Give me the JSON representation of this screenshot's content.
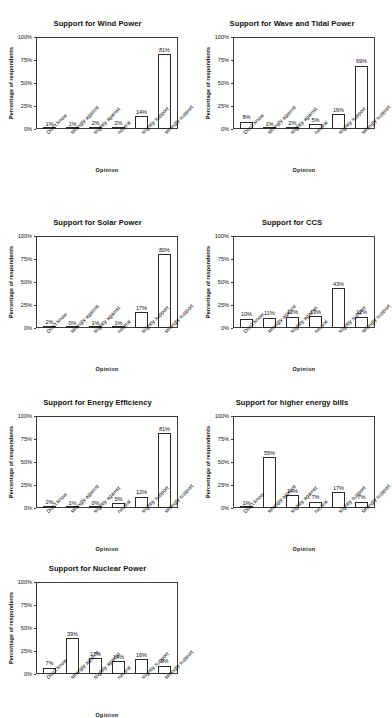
{
  "page": {
    "background": "#ffffff",
    "bar_fill": "#ffffff",
    "bar_stroke": "#2a2a2a",
    "axis_color": "#3b3b3b",
    "text_color": "#111111"
  },
  "shared": {
    "categories": [
      "Don't know",
      "strongly against",
      "slightly against",
      "neutral",
      "slightly support",
      "strongly support"
    ],
    "ylabel": "Percentage of respondents",
    "xlabel": "Opinion",
    "yticks": [
      "0%",
      "25%",
      "50%",
      "75%",
      "100%"
    ],
    "ytick_values": [
      0,
      25,
      50,
      75,
      100
    ],
    "ylim": [
      0,
      100
    ],
    "grid": false,
    "legend": "none"
  },
  "chart_data": [
    {
      "type": "bar",
      "title": "Support for Wind Power",
      "categories": [
        "Don't know",
        "strongly against",
        "slightly against",
        "neutral",
        "slightly support",
        "strongly support"
      ],
      "values": [
        1,
        1,
        2,
        2,
        14,
        81
      ],
      "labels": [
        "1%",
        "1%",
        "2%",
        "2%",
        "14%",
        "81%"
      ],
      "xlabel": "Opinion",
      "ylabel": "Percentage of respondents",
      "ylim": [
        0,
        100
      ]
    },
    {
      "type": "bar",
      "title": "Support for Wave and Tidal Power",
      "categories": [
        "Don't know",
        "strongly against",
        "slightly against",
        "neutral",
        "slightly support",
        "strongly support"
      ],
      "values": [
        8,
        1,
        2,
        5,
        16,
        69
      ],
      "labels": [
        "8%",
        "1%",
        "2%",
        "5%",
        "16%",
        "69%"
      ],
      "xlabel": "Opinion",
      "ylabel": "Percentage of respondents",
      "ylim": [
        0,
        100
      ]
    },
    {
      "type": "bar",
      "title": "Support for Solar Power",
      "categories": [
        "Don't know",
        "strongly against",
        "slightly against",
        "neutral",
        "slightly support",
        "strongly support"
      ],
      "values": [
        2,
        0,
        1,
        1,
        17,
        80
      ],
      "labels": [
        "2%",
        "0%",
        "1%",
        "1%",
        "17%",
        "80%"
      ],
      "xlabel": "Opinion",
      "ylabel": "Percentage of respondents",
      "ylim": [
        0,
        100
      ]
    },
    {
      "type": "bar",
      "title": "Support for CCS",
      "categories": [
        "Don't know",
        "strongly against",
        "slightly against",
        "neutral",
        "slightly support",
        "strongly support"
      ],
      "values": [
        10,
        11,
        12,
        13,
        43,
        12
      ],
      "labels": [
        "10%",
        "11%",
        "12%",
        "13%",
        "43%",
        "12%"
      ],
      "xlabel": "Opinion",
      "ylabel": "Percentage of respondents",
      "ylim": [
        0,
        100
      ]
    },
    {
      "type": "bar",
      "title": "Support for Energy Efficiency",
      "categories": [
        "Don't know",
        "strongly against",
        "slightly against",
        "neutral",
        "slightly support",
        "strongly support"
      ],
      "values": [
        2,
        1,
        0,
        5,
        12,
        81
      ],
      "labels": [
        "2%",
        "1%",
        "0%",
        "5%",
        "12%",
        "81%"
      ],
      "xlabel": "Opinion",
      "ylabel": "Percentage of respondents",
      "ylim": [
        0,
        100
      ]
    },
    {
      "type": "bar",
      "title": "Support for higher energy bills",
      "categories": [
        "Don't know",
        "strongly against",
        "slightly against",
        "neutral",
        "slightly support",
        "strongly support"
      ],
      "values": [
        1,
        55,
        14,
        7,
        17,
        7
      ],
      "labels": [
        "1%",
        "55%",
        "14%",
        "7%",
        "17%",
        "7%"
      ],
      "xlabel": "Opinion",
      "ylabel": "Percentage of respondents",
      "ylim": [
        0,
        100
      ]
    },
    {
      "type": "bar",
      "title": "Support for Nuclear Power",
      "categories": [
        "Don't know",
        "strongly against",
        "slightly against",
        "neutral",
        "slightly support",
        "strongly support"
      ],
      "values": [
        7,
        39,
        17,
        14,
        16,
        9
      ],
      "labels": [
        "7%",
        "39%",
        "17%",
        "14%",
        "16%",
        "9%"
      ],
      "xlabel": "Opinion",
      "ylabel": "Percentage of respondents",
      "ylim": [
        0,
        100
      ]
    }
  ]
}
